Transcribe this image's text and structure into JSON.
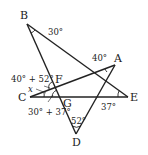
{
  "diagram": {
    "type": "geometry-star-figure",
    "points": {
      "A": {
        "label": "A",
        "x": 115,
        "y": 65
      },
      "B": {
        "label": "B",
        "x": 27,
        "y": 24
      },
      "C": {
        "label": "C",
        "x": 30,
        "y": 97
      },
      "D": {
        "label": "D",
        "x": 76,
        "y": 134
      },
      "E": {
        "label": "E",
        "x": 128,
        "y": 97
      },
      "F": {
        "label": "F",
        "x": 54,
        "y": 87
      },
      "G": {
        "label": "G",
        "x": 61,
        "y": 97
      }
    },
    "segments": [
      "BD",
      "BE",
      "CA",
      "CE",
      "AD"
    ],
    "angle_labels": {
      "B": "30°",
      "A": "40°",
      "E": "37°",
      "D": "52°",
      "F_top": "40° + 52°",
      "x": "x",
      "G_bottom": "30° + 37°"
    },
    "line_color": "#222222"
  }
}
